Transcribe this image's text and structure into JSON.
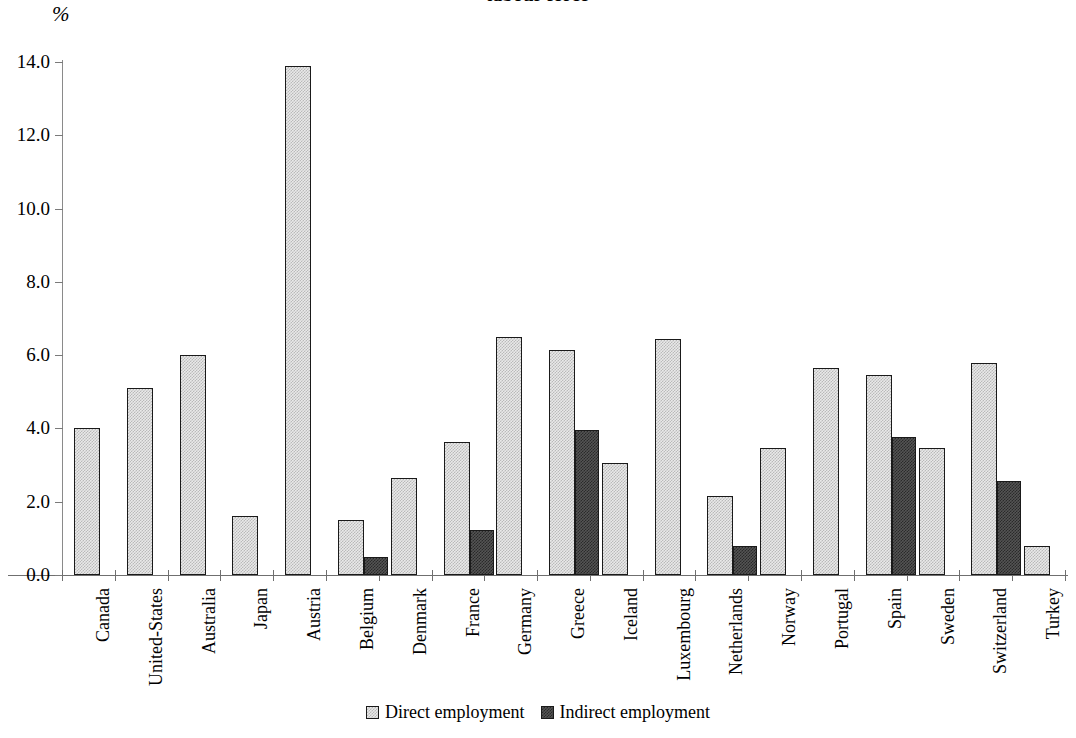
{
  "chart_data": {
    "type": "bar",
    "title": "labour force",
    "title_line1": "",
    "title_line2": "labour force",
    "ylabel": "%",
    "xlabel": "",
    "ylim": [
      0,
      14
    ],
    "ytick_labels": [
      "0.0",
      "2.0",
      "4.0",
      "6.0",
      "8.0",
      "10.0",
      "12.0",
      "14.0"
    ],
    "ytick_values": [
      0,
      2,
      4,
      6,
      8,
      10,
      12,
      14
    ],
    "grid": false,
    "legend_position": "bottom-center",
    "categories": [
      "Canada",
      "United-States",
      "Australia",
      "Japan",
      "Austria",
      "Belgium",
      "Denmark",
      "France",
      "Germany",
      "Greece",
      "Iceland",
      "Luxembourg",
      "Netherlands",
      "Norway",
      "Portugal",
      "Spain",
      "Sweden",
      "Switzerland",
      "Turkey"
    ],
    "series": [
      {
        "name": "Direct employment",
        "color": "#e9e9e9",
        "values": [
          4.0,
          5.1,
          6.0,
          1.6,
          13.9,
          1.5,
          2.65,
          3.63,
          6.5,
          6.15,
          3.05,
          6.45,
          2.15,
          3.47,
          5.65,
          5.46,
          3.47,
          5.78,
          0.78
        ]
      },
      {
        "name": "Indirect employment",
        "color": "#545454",
        "values": [
          null,
          null,
          null,
          null,
          null,
          0.5,
          null,
          1.22,
          null,
          3.95,
          null,
          null,
          0.78,
          null,
          null,
          3.77,
          null,
          2.57,
          null
        ]
      }
    ]
  },
  "legend": {
    "items": [
      {
        "label": "Direct employment",
        "swatch": "direct"
      },
      {
        "label": "Indirect employment",
        "swatch": "indirect"
      }
    ]
  }
}
